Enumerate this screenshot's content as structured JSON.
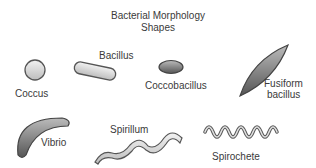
{
  "title": {
    "line1": "Bacterial Morphology",
    "line2": "Shapes"
  },
  "shapes": [
    {
      "id": "coccus",
      "label": "Coccus"
    },
    {
      "id": "bacillus",
      "label": "Bacillus"
    },
    {
      "id": "coccobacillus",
      "label": "Coccobacillus"
    },
    {
      "id": "fusiform",
      "label_line1": "Fusiform",
      "label_line2": "bacillus"
    },
    {
      "id": "vibrio",
      "label": "Vibrio"
    },
    {
      "id": "spirillum",
      "label": "Spirillum"
    },
    {
      "id": "spirochete",
      "label": "Spirochete"
    }
  ]
}
